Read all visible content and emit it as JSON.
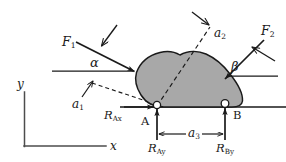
{
  "diagram": {
    "type": "free-body-diagram",
    "colors": {
      "body_fill": "#a8a8a8",
      "body_stroke": "#1a1a1a",
      "line": "#1a1a1a",
      "axis": "#555555",
      "background": "#ffffff",
      "support_marker_fill": "#ffffff"
    },
    "axes": {
      "y_label": "y",
      "x_label": "x",
      "origin": {
        "x": 24,
        "y": 146
      },
      "y_top": {
        "x": 24,
        "y": 92
      },
      "x_right": {
        "x": 106,
        "y": 146
      }
    },
    "forces": [
      {
        "name": "F1",
        "label_main": "F",
        "label_sub": "1",
        "angle_label": "α",
        "angle_name": "alpha",
        "description": "applied force at left, directed down-right into the body",
        "tail": {
          "x": 76,
          "y": 42
        },
        "tip": {
          "x": 136,
          "y": 72
        },
        "ref_line_from": {
          "x": 52,
          "y": 71
        },
        "ref_line_to": {
          "x": 140,
          "y": 71
        },
        "pointer_tail": {
          "x": 116,
          "y": 26
        },
        "pointer_tip": {
          "x": 103,
          "y": 45
        }
      },
      {
        "name": "F2",
        "label_main": "F",
        "label_sub": "2",
        "angle_label": "β",
        "angle_name": "beta",
        "description": "applied force at right, directed down-left into the body",
        "tail": {
          "x": 263,
          "y": 40
        },
        "tip": {
          "x": 226,
          "y": 78
        },
        "ref_line_from": {
          "x": 276,
          "y": 76
        },
        "ref_line_to": {
          "x": 224,
          "y": 76
        },
        "pointer_tail": {
          "x": 272,
          "y": 59
        },
        "pointer_tip": {
          "x": 252,
          "y": 48
        }
      }
    ],
    "dimensions": [
      {
        "name": "a1",
        "label_main": "a",
        "label_sub": "1",
        "style": "dashed-leader",
        "description": "dashed leader line from lower-left pointing up-right to the body edge",
        "from": {
          "x": 90,
          "y": 84
        },
        "to": {
          "x": 144,
          "y": 101
        },
        "arrow_tail": {
          "x": 82,
          "y": 96
        },
        "arrow_tip": {
          "x": 93,
          "y": 82
        }
      },
      {
        "name": "a2",
        "label_main": "a",
        "label_sub": "2",
        "style": "dashed-leader",
        "description": "dashed diagonal line from the A support up-right past the body",
        "from": {
          "x": 157,
          "y": 106
        },
        "to": {
          "x": 208,
          "y": 24
        },
        "arrow_tail": {
          "x": 191,
          "y": 13
        },
        "arrow_tip": {
          "x": 209,
          "y": 26
        }
      },
      {
        "name": "a3",
        "label_main": "a",
        "label_sub": "3",
        "style": "double-arrow-dimension",
        "description": "horizontal dimension between supports A and B",
        "from": {
          "x": 157,
          "y": 134
        },
        "to": {
          "x": 225,
          "y": 134
        }
      }
    ],
    "supports": [
      {
        "name": "A",
        "label": "A",
        "type": "pin",
        "position": {
          "x": 157,
          "y": 106
        },
        "reactions": [
          {
            "name": "RAx",
            "label_main": "R",
            "label_sub": "Ax",
            "direction": "horizontal-right"
          },
          {
            "name": "RAy",
            "label_main": "R",
            "label_sub": "Ay",
            "direction": "vertical-up"
          }
        ]
      },
      {
        "name": "B",
        "label": "B",
        "type": "roller",
        "position": {
          "x": 225,
          "y": 103
        },
        "reactions": [
          {
            "name": "RBy",
            "label_main": "R",
            "label_sub": "By",
            "direction": "vertical-up"
          }
        ]
      }
    ],
    "labels": {
      "F1": {
        "main": "F",
        "sub": "1"
      },
      "F2": {
        "main": "F",
        "sub": "2"
      },
      "alpha": "α",
      "beta": "β",
      "a1": {
        "main": "a",
        "sub": "1"
      },
      "a2": {
        "main": "a",
        "sub": "2"
      },
      "a3": {
        "main": "a",
        "sub": "3"
      },
      "RAx": {
        "main": "R",
        "sub": "Ax"
      },
      "RAy": {
        "main": "R",
        "sub": "Ay"
      },
      "RBy": {
        "main": "R",
        "sub": "By"
      },
      "A": "A",
      "B": "B",
      "x": "x",
      "y": "y"
    }
  }
}
